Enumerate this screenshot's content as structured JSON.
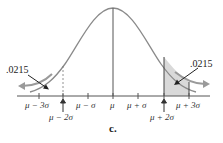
{
  "figure": {
    "caption": "c.",
    "type": "normal-distribution",
    "left_tail_probability": ".0215",
    "right_tail_probability": ".0215",
    "axis_labels": [
      "μ − 3σ",
      "μ − 2σ",
      "μ − σ",
      "μ",
      "μ + σ",
      "μ + 2σ",
      "μ + 3σ"
    ],
    "shaded_region": "between μ + 2σ and μ + 3σ",
    "dashed_boundary": "μ − 2σ",
    "colors": {
      "curve": "#8a8a8a",
      "shade": "#d9d9d9",
      "axis": "#555555",
      "arrow_curve": "#9a9a9a"
    }
  }
}
